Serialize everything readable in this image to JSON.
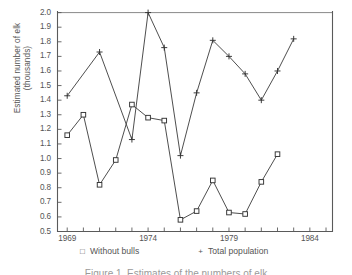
{
  "chart_data": {
    "type": "line",
    "title": "",
    "xlabel": "",
    "ylabel": "Estimated number of elk (thousands)",
    "ylabel_line1": "Estimated number of elk",
    "ylabel_line2": "(thousands)",
    "xlim": [
      1968.4,
      1985.4
    ],
    "ylim": [
      0.5,
      2.0
    ],
    "ytick_step": 0.1,
    "xtick_step": 1,
    "grid": false,
    "legend_position": "below-axis",
    "ytick_labels": [
      "2.0",
      "1.9",
      "1.8",
      "1.7",
      "1.6",
      "1.5",
      "1.4",
      "1.3",
      "1.2",
      "1.1",
      "1.0",
      "0.9",
      "0.8",
      "0.7",
      "0.6",
      "0.5"
    ],
    "ytick_values": [
      2.0,
      1.9,
      1.8,
      1.7,
      1.6,
      1.5,
      1.4,
      1.3,
      1.2,
      1.1,
      1.0,
      0.9,
      0.8,
      0.7,
      0.6,
      0.5
    ],
    "xtick_labels": [
      "1969",
      "1974",
      "1979",
      "1984"
    ],
    "xtick_values": [
      1969,
      1974,
      1979,
      1984
    ],
    "series": [
      {
        "name": "Total population",
        "marker": "+",
        "x": [
          1969,
          1971,
          1973,
          1974,
          1975,
          1976,
          1977,
          1978,
          1979,
          1980,
          1981,
          1982,
          1983
        ],
        "values": [
          1.43,
          1.73,
          1.13,
          2.0,
          1.76,
          1.02,
          1.45,
          1.81,
          1.7,
          1.58,
          1.4,
          1.6,
          1.82
        ]
      },
      {
        "name": "Without bulls",
        "marker": "square",
        "x": [
          1969,
          1970,
          1971,
          1972,
          1973,
          1974,
          1975,
          1976,
          1977,
          1978,
          1979,
          1980,
          1981,
          1982
        ],
        "values": [
          1.16,
          1.3,
          0.82,
          0.99,
          1.37,
          1.28,
          1.26,
          0.58,
          0.64,
          0.85,
          0.63,
          0.62,
          0.84,
          1.03
        ]
      }
    ]
  },
  "legend": {
    "items": [
      {
        "marker": "□",
        "label": "Without bulls"
      },
      {
        "marker": "+",
        "label": "Total population"
      }
    ]
  },
  "caption": {
    "text": "Figure 1. Estimates of the numbers of elk"
  },
  "colors": {
    "axis": "#555555",
    "line": "#444444",
    "marker": "#333333",
    "text": "#555555",
    "fringe_green": "#8fce8f",
    "fringe_red": "#e06a78",
    "fringe_teal": "#5f9e9e"
  }
}
